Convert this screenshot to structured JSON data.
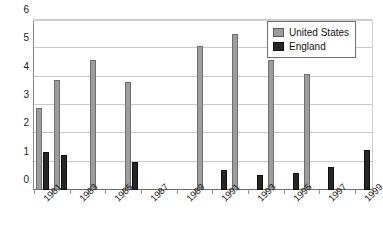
{
  "chart_data": {
    "type": "bar",
    "title": "",
    "subtitle": "",
    "xlabel": "",
    "ylabel": "",
    "ylim": [
      0,
      6
    ],
    "ytick_values": [
      0,
      1,
      2,
      3,
      4,
      5,
      6
    ],
    "ytick_labels": [
      "0",
      "1",
      "2",
      "3",
      "4",
      "5",
      "6"
    ],
    "grid": true,
    "grid_axis": "y",
    "legend_position": "top-right",
    "categories": [
      "1981",
      "1982",
      "1983",
      "1984",
      "1985",
      "1986",
      "1987",
      "1988",
      "1989",
      "1990",
      "1991",
      "1992",
      "1993",
      "1994",
      "1995",
      "1996",
      "1997",
      "1998",
      "1999"
    ],
    "xtick_labels_shown": [
      "1981",
      "",
      "1983",
      "",
      "1985",
      "",
      "1987",
      "",
      "1989",
      "",
      "1991",
      "",
      "1993",
      "",
      "1995",
      "",
      "1997",
      "",
      "1999"
    ],
    "series": [
      {
        "name": "United States",
        "color": "#9d9d9d",
        "values": [
          2.9,
          3.9,
          0,
          4.6,
          0,
          3.8,
          0,
          0,
          0,
          5.1,
          0,
          5.5,
          0,
          4.6,
          0,
          4.1,
          0,
          0,
          0
        ]
      },
      {
        "name": "England",
        "color": "#262626",
        "values": [
          1.35,
          1.22,
          0,
          0,
          0,
          0.98,
          0,
          0,
          0,
          0,
          0.72,
          0,
          0.54,
          0,
          0.59,
          0,
          0.82,
          0,
          1.42
        ]
      }
    ]
  },
  "legend": {
    "items": [
      {
        "label": "United States",
        "swatch": "us-swatch-icon"
      },
      {
        "label": "England",
        "swatch": "england-swatch-icon"
      }
    ]
  },
  "colors": {
    "united_states": "#9d9d9d",
    "england": "#262626",
    "gridline": "#c9c9c9",
    "axis": "#6b6b6b",
    "background": "#ffffff",
    "text": "#1a1a1a"
  }
}
